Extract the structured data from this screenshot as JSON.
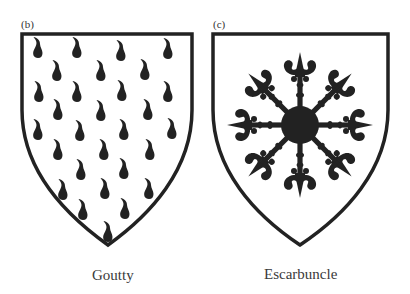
{
  "figure": {
    "panels": [
      {
        "id": "b",
        "label": "(b)",
        "caption": "Goutty",
        "charge": "drops (gouttes)"
      },
      {
        "id": "c",
        "label": "(c)",
        "caption": "Escarbuncle",
        "charge": "escarbuncle"
      }
    ],
    "colors": {
      "ink": "#222222",
      "field": "#ffffff",
      "text": "#3a3a3a"
    }
  }
}
